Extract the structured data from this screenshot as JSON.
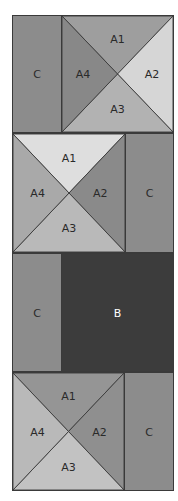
{
  "colors": {
    "C": "#8c8c8c",
    "B": "#3c3c3c",
    "outline": "#3a3a3a"
  },
  "rows": [
    {
      "layout": "C-left, square-right",
      "C": {
        "label": "C"
      },
      "square": {
        "A1": {
          "label": "A1",
          "color": "#9e9e9e"
        },
        "A2": {
          "label": "A2",
          "color": "#d6d6d6"
        },
        "A3": {
          "label": "A3",
          "color": "#b2b2b2"
        },
        "A4": {
          "label": "A4",
          "color": "#888888"
        }
      }
    },
    {
      "layout": "square-left, C-right",
      "C": {
        "label": "C"
      },
      "square": {
        "A1": {
          "label": "A1",
          "color": "#dedede"
        },
        "A2": {
          "label": "A2",
          "color": "#8a8a8a"
        },
        "A3": {
          "label": "A3",
          "color": "#b9b9b9"
        },
        "A4": {
          "label": "A4",
          "color": "#a9a9a9"
        }
      }
    },
    {
      "layout": "C-left, B-right",
      "C": {
        "label": "C"
      },
      "B": {
        "label": "B"
      }
    },
    {
      "layout": "square-left, C-right",
      "C": {
        "label": "C"
      },
      "square": {
        "A1": {
          "label": "A1",
          "color": "#959595"
        },
        "A2": {
          "label": "A2",
          "color": "#8f8f8f"
        },
        "A3": {
          "label": "A3",
          "color": "#c2c2c2"
        },
        "A4": {
          "label": "A4",
          "color": "#b9b9b9"
        }
      }
    }
  ]
}
